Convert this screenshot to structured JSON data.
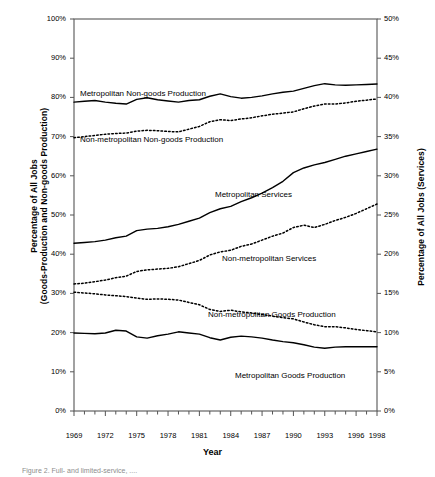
{
  "figure": {
    "caption": "Figure 2. Full- and limited-service, ....",
    "xlabel": "Year",
    "ylabel_left_line1": "Percentage of All Jobs",
    "ylabel_left_line2": "(Goods-Production and Non-goods Production)",
    "ylabel_right": "Percentage of All Jobs (Services)"
  },
  "chart_data": {
    "type": "line",
    "title": "",
    "xlabel": "Year",
    "ylabel": "Percentage of All Jobs (Goods-Production and Non-goods Production)",
    "ylabel_secondary": "Percentage of All Jobs (Services)",
    "grid": false,
    "legend_position": "inline-annotations",
    "xlim": [
      1969,
      1998
    ],
    "ylim": [
      0,
      100
    ],
    "ylim_secondary": [
      0,
      50
    ],
    "ytick_labels": [
      "0%",
      "10%",
      "20%",
      "30%",
      "40%",
      "50%",
      "60%",
      "70%",
      "80%",
      "90%",
      "100%"
    ],
    "ytick_values": [
      0,
      10,
      20,
      30,
      40,
      50,
      60,
      70,
      80,
      90,
      100
    ],
    "ytick_labels_secondary": [
      "0%",
      "5%",
      "10%",
      "15%",
      "20%",
      "25%",
      "30%",
      "35%",
      "40%",
      "45%",
      "50%"
    ],
    "ytick_values_secondary": [
      0,
      5,
      10,
      15,
      20,
      25,
      30,
      35,
      40,
      45,
      50
    ],
    "xtick_labels": [
      "1969",
      "1972",
      "1975",
      "1978",
      "1981",
      "1984",
      "1987",
      "1990",
      "1993",
      "1996",
      "1998"
    ],
    "xtick_values": [
      1969,
      1972,
      1975,
      1978,
      1981,
      1984,
      1987,
      1990,
      1993,
      1996,
      1998
    ],
    "x": [
      1969,
      1970,
      1971,
      1972,
      1973,
      1974,
      1975,
      1976,
      1977,
      1978,
      1979,
      1980,
      1981,
      1982,
      1983,
      1984,
      1985,
      1986,
      1987,
      1988,
      1989,
      1990,
      1991,
      1992,
      1993,
      1994,
      1995,
      1996,
      1997,
      1998
    ],
    "series": [
      {
        "name": "Metropolitan Non-goods Production",
        "axis": "left",
        "style": "solid",
        "color": "#000000",
        "values": [
          78.8,
          79.0,
          79.2,
          78.8,
          78.5,
          78.3,
          79.5,
          79.9,
          79.4,
          79.1,
          78.8,
          79.2,
          79.4,
          80.3,
          80.9,
          80.2,
          79.8,
          80.0,
          80.4,
          80.9,
          81.3,
          81.6,
          82.3,
          83.0,
          83.5,
          83.2,
          83.1,
          83.2,
          83.3,
          83.4
        ]
      },
      {
        "name": "Non-metropolitan Non-goods Production",
        "axis": "left",
        "style": "dotted",
        "color": "#000000",
        "values": [
          69.7,
          70.0,
          70.3,
          70.6,
          70.8,
          70.9,
          71.4,
          71.6,
          71.5,
          71.3,
          71.2,
          71.9,
          72.6,
          73.8,
          74.3,
          74.1,
          74.5,
          74.8,
          75.3,
          75.7,
          76.0,
          76.3,
          77.1,
          77.8,
          78.3,
          78.3,
          78.6,
          79.0,
          79.3,
          79.6
        ]
      },
      {
        "name": "Metropolitan Services",
        "axis": "right",
        "style": "solid",
        "color": "#000000",
        "values": [
          21.4,
          21.5,
          21.6,
          21.8,
          22.1,
          22.3,
          23.0,
          23.2,
          23.3,
          23.5,
          23.8,
          24.2,
          24.6,
          25.3,
          25.8,
          26.1,
          26.7,
          27.2,
          27.8,
          28.5,
          29.3,
          30.4,
          31.0,
          31.4,
          31.7,
          32.1,
          32.5,
          32.8,
          33.1,
          33.4
        ]
      },
      {
        "name": "Non-metropolitan Services",
        "axis": "right",
        "style": "dotted",
        "color": "#000000",
        "values": [
          16.2,
          16.3,
          16.5,
          16.7,
          17.0,
          17.2,
          17.8,
          18.0,
          18.1,
          18.2,
          18.4,
          18.8,
          19.2,
          19.9,
          20.3,
          20.5,
          21.0,
          21.3,
          21.8,
          22.3,
          22.7,
          23.4,
          23.7,
          23.4,
          23.8,
          24.3,
          24.7,
          25.2,
          25.8,
          26.4
        ]
      },
      {
        "name": "Non-metropolitan Goods Production",
        "axis": "left",
        "style": "dotted",
        "color": "#000000",
        "values": [
          30.3,
          30.1,
          29.9,
          29.6,
          29.4,
          29.2,
          28.8,
          28.5,
          28.6,
          28.5,
          28.3,
          27.7,
          27.1,
          25.9,
          25.4,
          25.7,
          25.3,
          25.0,
          24.6,
          24.2,
          23.8,
          23.5,
          22.7,
          22.0,
          21.5,
          21.5,
          21.2,
          20.8,
          20.5,
          20.2
        ]
      },
      {
        "name": "Metropolitan Goods Production",
        "axis": "left",
        "style": "solid",
        "color": "#000000",
        "values": [
          19.9,
          19.8,
          19.7,
          19.9,
          20.6,
          20.4,
          18.9,
          18.6,
          19.2,
          19.6,
          20.2,
          19.9,
          19.6,
          18.7,
          18.1,
          18.8,
          19.1,
          18.9,
          18.6,
          18.1,
          17.7,
          17.4,
          16.9,
          16.3,
          16.0,
          16.3,
          16.4,
          16.4,
          16.4,
          16.4
        ]
      }
    ],
    "annotations": [
      {
        "text": "Metropolitan Non-goods Production",
        "x_px": 80,
        "y_px": 89
      },
      {
        "text": "Non-metropolitan Non-goods Production",
        "x_px": 80,
        "y_px": 135
      },
      {
        "text": "Metropolitan Services",
        "x_px": 215,
        "y_px": 190
      },
      {
        "text": "Non-metropolitan Services",
        "x_px": 222,
        "y_px": 254
      },
      {
        "text": "Non-metropolitan Goods Production",
        "x_px": 208,
        "y_px": 310
      },
      {
        "text": "Metropolitan Goods Production",
        "x_px": 235,
        "y_px": 371
      }
    ]
  }
}
